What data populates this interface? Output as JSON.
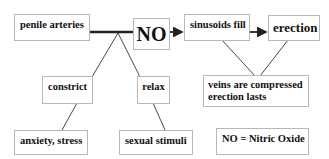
{
  "diagram": {
    "nodes": {
      "penile_arteries": "penile arteries",
      "no": "NO",
      "sinusoids_fill": "sinusoids fill",
      "erection": "erection",
      "constrict": "constrict",
      "relax": "relax",
      "veins_line1": "veins are compressed",
      "veins_line2": "erection lasts",
      "anxiety_stress": "anxiety, stress",
      "sexual_stimuli": "sexual stimuli",
      "legend": "NO = Nitric Oxide"
    },
    "edges": [
      {
        "from": "penile arteries",
        "to": "NO",
        "style": "thick-line"
      },
      {
        "from": "NO",
        "to": "sinusoids fill",
        "style": "arrow"
      },
      {
        "from": "sinusoids fill",
        "to": "erection",
        "style": "arrow"
      },
      {
        "from": "junction",
        "to": "constrict",
        "style": "line"
      },
      {
        "from": "junction",
        "to": "relax",
        "style": "line"
      },
      {
        "from": "constrict",
        "to": "anxiety, stress",
        "style": "line"
      },
      {
        "from": "relax",
        "to": "sexual stimuli",
        "style": "line"
      },
      {
        "from": "sinusoids fill",
        "to": "veins are compressed / erection lasts",
        "style": "line"
      },
      {
        "from": "erection",
        "to": "veins are compressed / erection lasts",
        "style": "line"
      }
    ],
    "colors": {
      "line": "#222222",
      "box_border": "#b8b8b8",
      "text": "#111111"
    }
  }
}
